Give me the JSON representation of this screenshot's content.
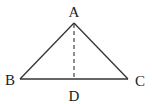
{
  "diagram": {
    "type": "triangle-with-altitude",
    "colors": {
      "stroke": "#333333",
      "background": "#ffffff",
      "text": "#222222"
    },
    "vertices": {
      "A": {
        "label": "A",
        "x": 74,
        "y": 23
      },
      "B": {
        "label": "B",
        "x": 20,
        "y": 79
      },
      "C": {
        "label": "C",
        "x": 128,
        "y": 79
      },
      "D": {
        "label": "D",
        "x": 74,
        "y": 79
      }
    },
    "segments": [
      {
        "from": "A",
        "to": "B",
        "style": "solid"
      },
      {
        "from": "A",
        "to": "C",
        "style": "solid"
      },
      {
        "from": "B",
        "to": "C",
        "style": "solid"
      },
      {
        "from": "A",
        "to": "D",
        "style": "dashed"
      }
    ],
    "labels": {
      "A": "A",
      "B": "B",
      "C": "C",
      "D": "D"
    }
  }
}
